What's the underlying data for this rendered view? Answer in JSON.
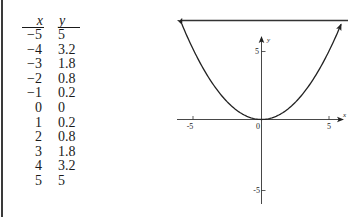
{
  "table": {
    "headers": {
      "x": "x",
      "y": "y"
    },
    "rows": [
      {
        "x": "−5",
        "y": "5"
      },
      {
        "x": "−4",
        "y": "3.2"
      },
      {
        "x": "−3",
        "y": "1.8"
      },
      {
        "x": "−2",
        "y": "0.8"
      },
      {
        "x": "−1",
        "y": "0.2"
      },
      {
        "x": "0",
        "y": "0"
      },
      {
        "x": "1",
        "y": "0.2"
      },
      {
        "x": "2",
        "y": "0.8"
      },
      {
        "x": "3",
        "y": "1.8"
      },
      {
        "x": "4",
        "y": "3.2"
      },
      {
        "x": "5",
        "y": "5"
      }
    ]
  },
  "graph": {
    "x_axis_label": "x",
    "y_axis_label": "y",
    "origin_label": "0",
    "x_tick_labels": {
      "neg": "-5",
      "pos": "5"
    },
    "y_tick_labels": {
      "pos": "5",
      "neg": "-5"
    }
  },
  "chart_data": {
    "type": "line",
    "title": "",
    "function": "y = x^2 / 5",
    "xlabel": "x",
    "ylabel": "y",
    "x": [
      -5,
      -4,
      -3,
      -2,
      -1,
      0,
      1,
      2,
      3,
      4,
      5
    ],
    "values": [
      5,
      3.2,
      1.8,
      0.8,
      0.2,
      0,
      0.2,
      0.8,
      1.8,
      3.2,
      5
    ],
    "series": [
      {
        "name": "y = x²/5",
        "x": [
          -5,
          -4,
          -3,
          -2,
          -1,
          0,
          1,
          2,
          3,
          4,
          5
        ],
        "values": [
          5,
          3.2,
          1.8,
          0.8,
          0.2,
          0,
          0.2,
          0.8,
          1.8,
          3.2,
          5
        ]
      }
    ],
    "xticks": [
      -5,
      0,
      5
    ],
    "yticks": [
      -5,
      5
    ],
    "xlim": [
      -6,
      6
    ],
    "ylim": [
      -6,
      6
    ],
    "grid": false,
    "legend": "none",
    "curve_arrows_both_ends": true
  }
}
